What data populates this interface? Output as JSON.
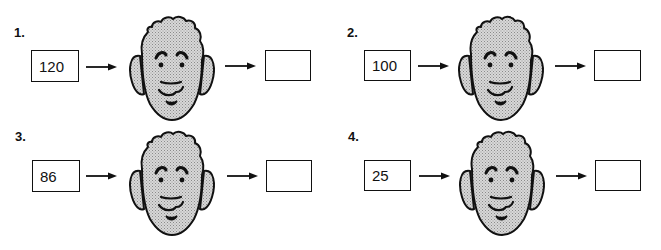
{
  "worksheet": {
    "problems": [
      {
        "number": "1.",
        "input": "120",
        "output": ""
      },
      {
        "number": "2.",
        "input": "100",
        "output": ""
      },
      {
        "number": "3.",
        "input": "86",
        "output": ""
      },
      {
        "number": "4.",
        "input": "25",
        "output": ""
      }
    ],
    "icons": {
      "arrow": "right-arrow-icon",
      "face": "cartoon-face-icon"
    },
    "colors": {
      "ink": "#111111",
      "face_fill": "#c9c9c9",
      "background": "#ffffff"
    }
  }
}
